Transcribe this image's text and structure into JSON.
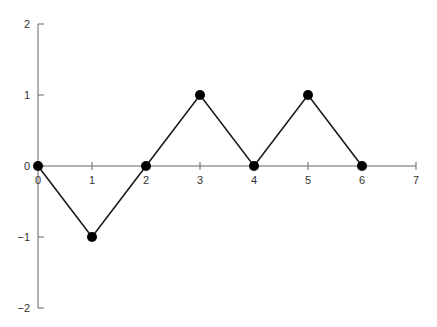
{
  "chart_data": {
    "type": "line",
    "title": "",
    "xlabel": "",
    "ylabel": "",
    "x": [
      0,
      1,
      2,
      3,
      4,
      5,
      6
    ],
    "series": [
      {
        "name": "series",
        "values": [
          0,
          -1,
          0,
          1,
          0,
          1,
          0
        ]
      }
    ],
    "xlim": [
      0,
      7
    ],
    "ylim": [
      -2,
      2
    ],
    "x_ticks": [
      "0",
      "1",
      "2",
      "3",
      "4",
      "5",
      "6",
      "7"
    ],
    "y_ticks": [
      "-2",
      "-1",
      "0",
      "1",
      "2"
    ],
    "grid": false,
    "legend": "none",
    "markers": true,
    "colors": {
      "line": "#1a1a1a",
      "marker": "#000000",
      "axis": "#666666",
      "text": "#333333"
    }
  }
}
